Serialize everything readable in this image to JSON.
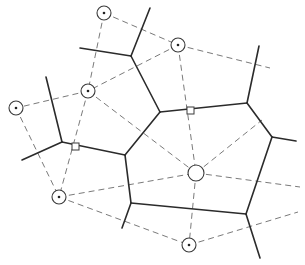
{
  "diagram": {
    "type": "voronoi-delaunay",
    "canvas": {
      "width": 305,
      "height": 265
    },
    "colors": {
      "voronoi": "#2b2b2b",
      "delaunay": "#7a7a7a",
      "site": "#3a3a3a"
    },
    "sites": [
      {
        "id": "A",
        "x": 104,
        "y": 13,
        "r": 7,
        "dot": true
      },
      {
        "id": "B",
        "x": 178,
        "y": 45,
        "r": 7,
        "dot": true
      },
      {
        "id": "C",
        "x": 88,
        "y": 91,
        "r": 7,
        "dot": true
      },
      {
        "id": "D",
        "x": 16,
        "y": 108,
        "r": 7,
        "dot": true
      },
      {
        "id": "E",
        "x": 59,
        "y": 197,
        "r": 7,
        "dot": true
      },
      {
        "id": "F",
        "x": 189,
        "y": 245,
        "r": 7,
        "dot": true
      },
      {
        "id": "G",
        "x": 196,
        "y": 173,
        "r": 8,
        "dot": false
      }
    ],
    "delaunay_edges": [
      [
        104,
        13,
        178,
        45
      ],
      [
        104,
        13,
        88,
        91
      ],
      [
        178,
        45,
        88,
        91
      ],
      [
        178,
        45,
        270,
        68
      ],
      [
        178,
        45,
        196,
        173
      ],
      [
        88,
        91,
        16,
        108
      ],
      [
        88,
        91,
        59,
        197
      ],
      [
        88,
        91,
        196,
        173
      ],
      [
        16,
        108,
        59,
        197
      ],
      [
        59,
        197,
        196,
        173
      ],
      [
        59,
        197,
        189,
        245
      ],
      [
        196,
        173,
        189,
        245
      ],
      [
        196,
        173,
        300,
        187
      ],
      [
        196,
        173,
        262,
        120
      ],
      [
        189,
        245,
        298,
        212
      ]
    ],
    "voronoi_edges": [
      [
        131,
        56,
        150,
        8
      ],
      [
        131,
        56,
        80,
        48
      ],
      [
        131,
        56,
        160,
        112
      ],
      [
        160,
        112,
        247,
        103
      ],
      [
        160,
        112,
        125,
        155
      ],
      [
        247,
        103,
        259,
        46
      ],
      [
        247,
        103,
        272,
        137
      ],
      [
        272,
        137,
        296,
        141
      ],
      [
        272,
        137,
        246,
        214
      ],
      [
        246,
        214,
        260,
        258
      ],
      [
        246,
        214,
        131,
        203
      ],
      [
        131,
        203,
        122,
        228
      ],
      [
        131,
        203,
        125,
        155
      ],
      [
        125,
        155,
        62,
        142
      ],
      [
        62,
        142,
        46,
        77
      ],
      [
        62,
        142,
        22,
        160
      ]
    ],
    "right_angle_markers": [
      {
        "x": 72,
        "y": 143,
        "size": 7
      },
      {
        "x": 187,
        "y": 107,
        "size": 7
      }
    ]
  }
}
